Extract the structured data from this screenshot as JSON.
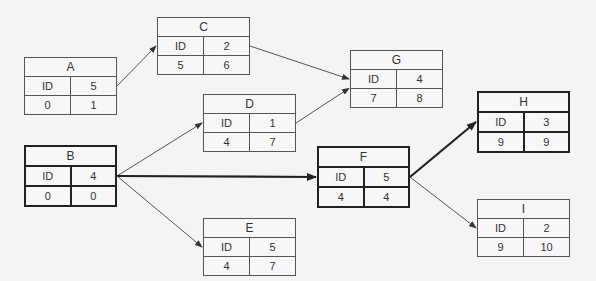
{
  "diagram": {
    "type": "activity-on-node network",
    "nodes": [
      {
        "id": "A",
        "title": "A",
        "id_label": "ID",
        "duration": "5",
        "es": "0",
        "ef": "1",
        "critical": false
      },
      {
        "id": "B",
        "title": "B",
        "id_label": "ID",
        "duration": "4",
        "es": "0",
        "ef": "0",
        "critical": true
      },
      {
        "id": "C",
        "title": "C",
        "id_label": "ID",
        "duration": "2",
        "es": "5",
        "ef": "6",
        "critical": false
      },
      {
        "id": "D",
        "title": "D",
        "id_label": "ID",
        "duration": "1",
        "es": "4",
        "ef": "7",
        "critical": false
      },
      {
        "id": "E",
        "title": "E",
        "id_label": "ID",
        "duration": "5",
        "es": "4",
        "ef": "7",
        "critical": false
      },
      {
        "id": "F",
        "title": "F",
        "id_label": "ID",
        "duration": "5",
        "es": "4",
        "ef": "4",
        "critical": true
      },
      {
        "id": "G",
        "title": "G",
        "id_label": "ID",
        "duration": "4",
        "es": "7",
        "ef": "8",
        "critical": false
      },
      {
        "id": "H",
        "title": "H",
        "id_label": "ID",
        "duration": "3",
        "es": "9",
        "ef": "9",
        "critical": true
      },
      {
        "id": "I",
        "title": "I",
        "id_label": "ID",
        "duration": "2",
        "es": "9",
        "ef": "10",
        "critical": false
      }
    ],
    "edges": [
      {
        "from": "A",
        "to": "C",
        "critical": false
      },
      {
        "from": "C",
        "to": "G",
        "critical": false
      },
      {
        "from": "D",
        "to": "G",
        "critical": false
      },
      {
        "from": "B",
        "to": "D",
        "critical": false
      },
      {
        "from": "B",
        "to": "F",
        "critical": true
      },
      {
        "from": "B",
        "to": "E",
        "critical": false
      },
      {
        "from": "F",
        "to": "H",
        "critical": true
      },
      {
        "from": "F",
        "to": "I",
        "critical": false
      }
    ],
    "colors": {
      "line": "#555555",
      "critical_line": "#222222",
      "background": "#f4f4f4"
    }
  }
}
